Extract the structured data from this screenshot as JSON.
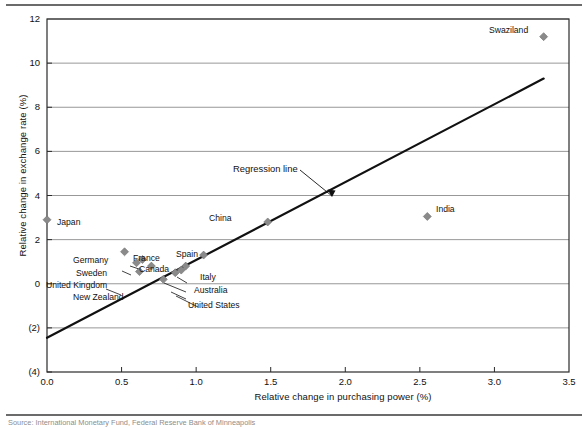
{
  "figure": {
    "has_top_rule": true,
    "has_bottom_rule": true,
    "source_note": "Source: International Monetary Fund, Federal Reserve Bank of Minneapolis"
  },
  "chart_data": {
    "type": "scatter",
    "title": "",
    "xlabel": "Relative change in purchasing power (%)",
    "ylabel": "Relative change in exchange rate (%)",
    "xlim": [
      0.0,
      3.5
    ],
    "ylim": [
      -4,
      12
    ],
    "xticks": [
      0.0,
      0.5,
      1.0,
      1.5,
      2.0,
      2.5,
      3.0,
      3.5
    ],
    "xticklabels": [
      "0.0",
      "0.5",
      "1.0",
      "1.5",
      "2.0",
      "2.5",
      "3.0",
      "3.5"
    ],
    "yticks": [
      12,
      10,
      8,
      6,
      4,
      2,
      0,
      -2,
      -4
    ],
    "yticklabels": [
      "12",
      "10",
      "8",
      "6",
      "4",
      "2",
      "0",
      "(2)",
      "(4)"
    ],
    "grid": "horizontal",
    "legend": "none",
    "marker_color": "#8a8a8a",
    "line_color": "#111111",
    "points": [
      {
        "name": "Swaziland",
        "x": 3.33,
        "y": 11.2,
        "label": "Swaziland",
        "label_pos": "left"
      },
      {
        "name": "India",
        "x": 2.55,
        "y": 3.05,
        "label": "India",
        "label_pos": "right"
      },
      {
        "name": "China",
        "x": 1.48,
        "y": 2.8,
        "label": "China",
        "label_pos": "left"
      },
      {
        "name": "Japan",
        "x": 0.0,
        "y": 2.9,
        "label": "Japan",
        "label_pos": "right"
      },
      {
        "name": "Germany",
        "x": 0.52,
        "y": 1.45,
        "label": "Germany",
        "label_pos": "left"
      },
      {
        "name": "France",
        "x": 0.64,
        "y": 1.1,
        "label": "France",
        "label_pos": "above"
      },
      {
        "name": "Spain",
        "x": 1.05,
        "y": 1.3,
        "label": "Spain",
        "label_pos": "above"
      },
      {
        "name": "Sweden",
        "x": 0.6,
        "y": 0.95,
        "label": "Sweden",
        "label_pos": "left"
      },
      {
        "name": "Canada",
        "x": 0.7,
        "y": 0.8,
        "label": "Canada",
        "label_pos": "above"
      },
      {
        "name": "United Kingdom",
        "x": 0.62,
        "y": 0.55,
        "label": "United Kingdom",
        "label_pos": "left"
      },
      {
        "name": "Italy",
        "x": 0.93,
        "y": 0.8,
        "label": "Italy",
        "label_pos": "right"
      },
      {
        "name": "Australia",
        "x": 0.9,
        "y": 0.62,
        "label": "Australia",
        "label_pos": "right"
      },
      {
        "name": "United States",
        "x": 0.86,
        "y": 0.5,
        "label": "United States",
        "label_pos": "below-right"
      },
      {
        "name": "New Zealand",
        "x": 0.78,
        "y": 0.2,
        "label": "New Zealand",
        "label_pos": "left"
      }
    ],
    "annotations": [
      {
        "name": "regression-line-label",
        "text": "Regression line",
        "x": 1.28,
        "y": 5.15
      }
    ],
    "regression_line": {
      "x_start": 0.0,
      "y_start": -2.45,
      "x_end": 3.33,
      "y_end": 9.3
    }
  }
}
